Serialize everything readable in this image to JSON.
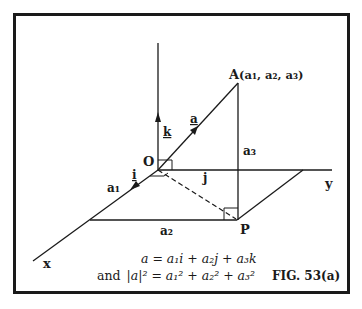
{
  "figure": {
    "caption": "FIG. 53(a)",
    "point_A_label": "A",
    "point_A_coords": "(a₁, a₂, a₃)",
    "origin_label": "O",
    "point_P_label": "P",
    "axis_x_label": "x",
    "axis_y_label": "y",
    "unit_i": "i",
    "unit_j": "j",
    "unit_k": "k",
    "vector_a": "a",
    "component_a1": "a₁",
    "component_a2": "a₂",
    "component_a3": "a₃",
    "equation_1": "a = a₁i + a₂j + a₃k",
    "equation_2_prefix": "and",
    "equation_2": "|a|² = a₁² + a₂² + a₃²"
  },
  "colors": {
    "ink": "#1a1a1a",
    "background": "#ffffff"
  }
}
